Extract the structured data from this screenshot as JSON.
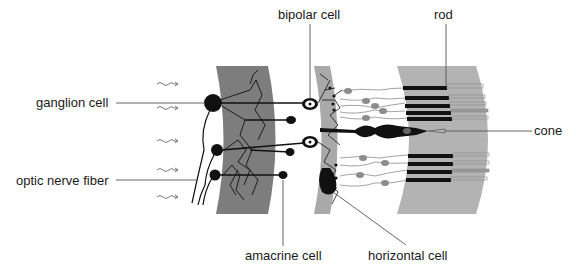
{
  "diagram": {
    "labels": {
      "ganglion_cell": "ganglion cell",
      "optic_nerve_fiber": "optic nerve fiber",
      "bipolar_cell": "bipolar cell",
      "amacrine_cell": "amacrine cell",
      "horizontal_cell": "horizontal cell",
      "rod": "rod",
      "cone": "cone"
    },
    "colors": {
      "inner_layer": "#7d7d7d",
      "middle_layer": "#a9a9a9",
      "outer_layer": "#b3b3b3",
      "cell": "#111111",
      "nucleus_gray": "#8c8c8c",
      "leader_line": "#555555"
    },
    "light_arrows": 5
  }
}
